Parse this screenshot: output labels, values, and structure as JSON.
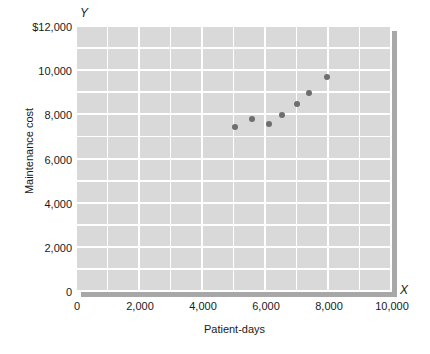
{
  "chart_data": {
    "type": "scatter",
    "title": "",
    "xlabel": "Patient-days",
    "ylabel": "Maintenance cost",
    "xlim": [
      0,
      10000
    ],
    "ylim": [
      0,
      12000
    ],
    "grid": true,
    "legend": null,
    "x_axis_letter": "X",
    "y_axis_letter": "Y",
    "xticks": [
      {
        "value": 0,
        "label": "0"
      },
      {
        "value": 2000,
        "label": "2,000"
      },
      {
        "value": 4000,
        "label": "4,000"
      },
      {
        "value": 6000,
        "label": "6,000"
      },
      {
        "value": 8000,
        "label": "8,000"
      },
      {
        "value": 10000,
        "label": "10,000"
      }
    ],
    "yticks": [
      {
        "value": 0,
        "label": "0"
      },
      {
        "value": 2000,
        "label": "2,000"
      },
      {
        "value": 4000,
        "label": "4,000"
      },
      {
        "value": 6000,
        "label": "6,000"
      },
      {
        "value": 8000,
        "label": "8,000"
      },
      {
        "value": 10000,
        "label": "10,000"
      },
      {
        "value": 12000,
        "label": "$12,000"
      }
    ],
    "gridline_step_x": 1000,
    "gridline_step_y": 1000,
    "points": [
      {
        "x": 5000,
        "y": 7450
      },
      {
        "x": 5550,
        "y": 7820
      },
      {
        "x": 6080,
        "y": 7600
      },
      {
        "x": 6500,
        "y": 8020
      },
      {
        "x": 6980,
        "y": 8500
      },
      {
        "x": 7350,
        "y": 9020
      },
      {
        "x": 7930,
        "y": 9720
      }
    ],
    "colors": {
      "plot_background": "#d9d9d9",
      "gridline": "#ffffff",
      "point": "#6e6e6e",
      "shadow": "#a8a8a8",
      "text": "#1a1a1a",
      "page_background": "#ffffff"
    }
  }
}
